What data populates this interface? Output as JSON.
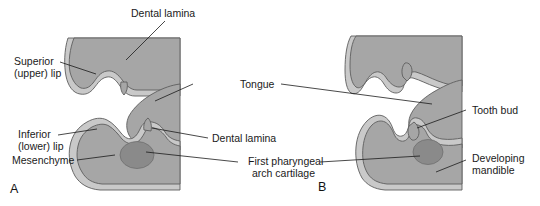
{
  "figure": {
    "type": "anatomical-diagram"
  },
  "colors": {
    "background": "#ffffff",
    "epithelium": "#c9c9c9",
    "mesenchyme": "#a6a6a6",
    "cartilage": "#8a8a8a",
    "outline": "#5e5e5e",
    "leader_line": "#1a1a1a",
    "text": "#1a1a1a"
  },
  "panels": [
    {
      "id": "A",
      "letter": "A"
    },
    {
      "id": "B",
      "letter": "B"
    }
  ],
  "labels": {
    "dental_lamina_top": "Dental lamina",
    "superior_lip_line1": "Superior",
    "superior_lip_line2": "(upper) lip",
    "inferior_lip_line1": "Inferior",
    "inferior_lip_line2": "(lower) lip",
    "mesenchyme": "Mesenchyme",
    "tongue": "Tongue",
    "dental_lamina_mid": "Dental lamina",
    "first_arch_line1": "First pharyngeal",
    "first_arch_line2": "arch cartilage",
    "tooth_bud": "Tooth bud",
    "developing_mandible_line1": "Developing",
    "developing_mandible_line2": "mandible"
  }
}
